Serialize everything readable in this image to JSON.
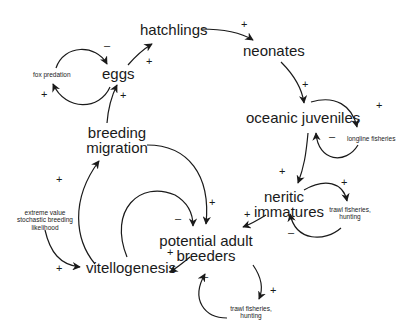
{
  "diagram": {
    "type": "causal-loop",
    "nodes": {
      "eggs": "eggs",
      "hatchlings": "hatchlings",
      "neonates": "neonates",
      "oceanic_juveniles": "oceanic juveniles",
      "neritic_immatures_1": "neritic",
      "neritic_immatures_2": "immatures",
      "potential_adult_breeders_1": "potential adult",
      "potential_adult_breeders_2": "breeders",
      "vitellogenesis": "vitellogenesis",
      "breeding_migration_1": "breeding",
      "breeding_migration_2": "migration",
      "fox_predation": "fox predation",
      "longline_fisheries": "longline fisheries",
      "trawl_neritic_1": "trawl fisheries,",
      "trawl_neritic_2": "hunting",
      "trawl_adult_1": "trawl fisheries,",
      "trawl_adult_2": "hunting",
      "extreme_1": "extreme value",
      "extreme_2": "stochastic breeding",
      "extreme_3": "likelihood"
    },
    "edges": [
      {
        "from": "eggs",
        "to": "hatchlings",
        "sign": "+"
      },
      {
        "from": "hatchlings",
        "to": "neonates",
        "sign": "+"
      },
      {
        "from": "neonates",
        "to": "oceanic juveniles",
        "sign": "+"
      },
      {
        "from": "oceanic juveniles",
        "to": "neritic immatures",
        "sign": "+"
      },
      {
        "from": "neritic immatures",
        "to": "potential adult breeders",
        "sign": "+"
      },
      {
        "from": "potential adult breeders",
        "to": "vitellogenesis",
        "sign": "+"
      },
      {
        "from": "vitellogenesis",
        "to": "breeding migration",
        "sign": "+"
      },
      {
        "from": "vitellogenesis",
        "to": "potential adult breeders",
        "sign": "-"
      },
      {
        "from": "breeding migration",
        "to": "eggs",
        "sign": "+"
      },
      {
        "from": "breeding migration",
        "to": "potential adult breeders",
        "sign": "+"
      },
      {
        "from": "eggs",
        "to": "fox predation",
        "sign": "+"
      },
      {
        "from": "fox predation",
        "to": "eggs",
        "sign": "-"
      },
      {
        "from": "oceanic juveniles",
        "to": "longline fisheries",
        "sign": "+"
      },
      {
        "from": "longline fisheries",
        "to": "oceanic juveniles",
        "sign": "-"
      },
      {
        "from": "neritic immatures",
        "to": "trawl fisheries, hunting",
        "sign": "+"
      },
      {
        "from": "trawl fisheries, hunting",
        "to": "neritic immatures",
        "sign": "-"
      },
      {
        "from": "potential adult breeders",
        "to": "trawl fisheries, hunting",
        "sign": "+"
      },
      {
        "from": "trawl fisheries, hunting",
        "to": "potential adult breeders",
        "sign": "-"
      },
      {
        "from": "extreme value stochastic breeding likelihood",
        "to": "vitellogenesis",
        "sign": "+"
      }
    ],
    "signs": {
      "plus": "+",
      "minus": "–"
    }
  }
}
